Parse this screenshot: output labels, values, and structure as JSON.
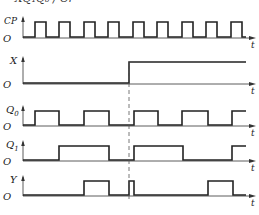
{
  "caption": "= XQ₁Q₀ / Cr",
  "time_label": "t",
  "origin_label": "O",
  "colors": {
    "signal": "#222222",
    "axis": "#333333",
    "dashed": "#555555"
  },
  "marker_x": 129,
  "signals": [
    {
      "name": "CP",
      "label": "CP",
      "baseline": 37,
      "high": 22,
      "edges": [
        [
          35,
          46
        ],
        [
          59,
          70
        ],
        [
          84,
          95
        ],
        [
          108,
          119
        ],
        [
          133,
          144
        ],
        [
          157,
          168
        ],
        [
          182,
          193
        ],
        [
          206,
          217
        ],
        [
          231,
          242
        ]
      ],
      "end": 246
    },
    {
      "name": "X",
      "label": "X",
      "baseline": 83,
      "high": 62,
      "edges": [
        [
          129,
          246
        ]
      ],
      "end": 246
    },
    {
      "name": "Q0",
      "label": "Q0",
      "baseline": 125,
      "high": 111,
      "edges": [
        [
          35,
          59
        ],
        [
          84,
          109
        ],
        [
          134,
          158
        ],
        [
          182,
          208
        ],
        [
          232,
          246
        ]
      ],
      "end": 246
    },
    {
      "name": "Q1",
      "label": "Q1",
      "baseline": 160,
      "high": 146,
      "edges": [
        [
          59,
          109
        ],
        [
          134,
          183
        ],
        [
          232,
          246
        ]
      ],
      "end": 246
    },
    {
      "name": "Y",
      "label": "Y",
      "baseline": 195,
      "high": 181,
      "edges": [
        [
          84,
          109
        ],
        [
          129,
          134
        ],
        [
          208,
          233
        ]
      ],
      "end": 246
    }
  ]
}
